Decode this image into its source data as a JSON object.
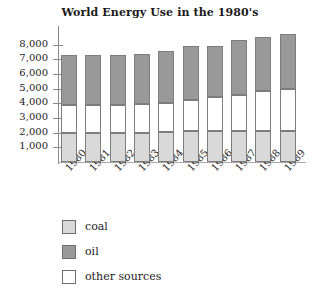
{
  "chart_data": {
    "type": "bar",
    "subtype": "stacked-vertical",
    "title": "World Energy Use in the 1980's",
    "xlabel": "",
    "ylabel": "",
    "ylim": [
      0,
      9000
    ],
    "ytick_step": 1000,
    "grid": false,
    "legend_position": "below-left",
    "ytick_labels": [
      "8,000",
      "7,000",
      "6,000",
      "5,000",
      "4,000",
      "3,000",
      "2,000",
      "1,000"
    ],
    "ytick_values": [
      8000,
      7000,
      6000,
      5000,
      4000,
      3000,
      2000,
      1000
    ],
    "categories": [
      "1980",
      "1981",
      "1982",
      "1983",
      "1984",
      "1985",
      "1986",
      "1987",
      "1988",
      "1989"
    ],
    "series": [
      {
        "name": "coal",
        "color": "#d9d9d9",
        "values": [
          2000,
          2000,
          2000,
          2000,
          2050,
          2100,
          2100,
          2100,
          2100,
          2100
        ]
      },
      {
        "name": "other sources",
        "color": "#ffffff",
        "values": [
          1900,
          1900,
          1900,
          1950,
          2000,
          2100,
          2300,
          2500,
          2750,
          2900
        ]
      },
      {
        "name": "oil",
        "color": "#999999",
        "values": [
          3400,
          3400,
          3400,
          3400,
          3500,
          3700,
          3500,
          3700,
          3700,
          3700
        ]
      }
    ],
    "totals": [
      7300,
      7300,
      7300,
      7350,
      7550,
      7900,
      7900,
      8300,
      8550,
      8700
    ],
    "legend_entries": [
      {
        "label": "coal",
        "color": "#d9d9d9"
      },
      {
        "label": "oil",
        "color": "#999999"
      },
      {
        "label": "other sources",
        "color": "#ffffff"
      }
    ],
    "colors": {
      "coal": "#d9d9d9",
      "oil": "#999999",
      "other_sources": "#ffffff",
      "outline": "#7d7d7d",
      "axis": "#8a8a8a",
      "text": "#1a1a1a"
    }
  }
}
